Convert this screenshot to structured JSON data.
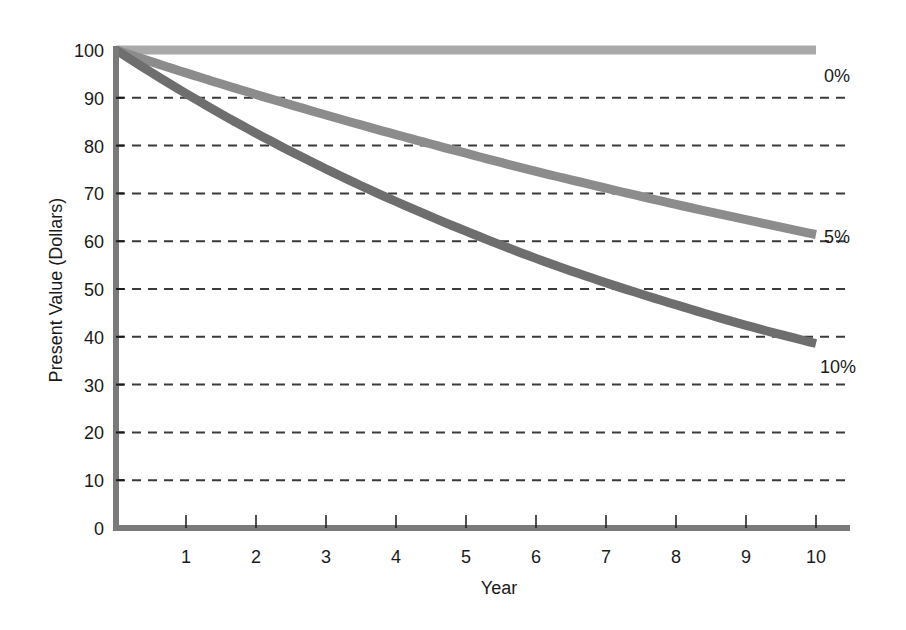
{
  "chart_data": {
    "type": "line",
    "title": "",
    "xlabel": "Year",
    "ylabel": "Present Value (Dollars)",
    "x": [
      0,
      1,
      2,
      3,
      4,
      5,
      6,
      7,
      8,
      9,
      10
    ],
    "x_ticks": [
      "1",
      "2",
      "3",
      "4",
      "5",
      "6",
      "7",
      "8",
      "9",
      "10"
    ],
    "y_ticks": [
      "0",
      "10",
      "20",
      "30",
      "40",
      "50",
      "60",
      "70",
      "80",
      "90",
      "100"
    ],
    "xlim": [
      0,
      10.5
    ],
    "ylim": [
      0,
      100
    ],
    "grid": {
      "horizontal": true,
      "style": "dashed",
      "vertical": false
    },
    "legend": {
      "position": "inline-right-end-labels"
    },
    "series": [
      {
        "name": "0%",
        "color": "#a9a9a9",
        "values": [
          100,
          100,
          100,
          100,
          100,
          100,
          100,
          100,
          100,
          100,
          100
        ]
      },
      {
        "name": "5%",
        "color": "#8c8c8c",
        "values": [
          100,
          95.2,
          90.7,
          86.4,
          82.3,
          78.4,
          74.6,
          71.1,
          67.7,
          64.5,
          61.4
        ]
      },
      {
        "name": "10%",
        "color": "#6e6e6e",
        "values": [
          100,
          90.9,
          82.6,
          75.1,
          68.3,
          62.1,
          56.4,
          51.3,
          46.7,
          42.4,
          38.6
        ]
      }
    ]
  },
  "colors": {
    "axis": "#7a7a7a",
    "grid": "#3a3a3a",
    "text": "#1a1a1a"
  }
}
